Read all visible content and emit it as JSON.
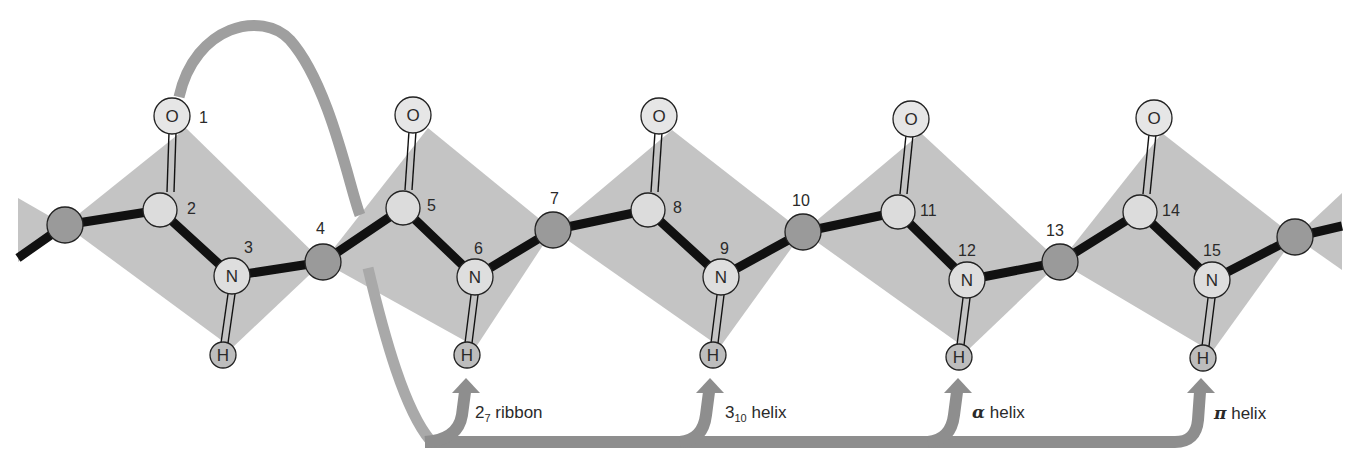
{
  "diagram": {
    "colors": {
      "plane": "#c4c4c4",
      "alpha_carbon": "#9a9a9a",
      "light_atom": "#dcdcdc",
      "bond": "#111111",
      "arrow": "#8e8e8e",
      "loop_ribbon": "#a9a9a9",
      "text": "#2a2a2a"
    },
    "atom_symbols": {
      "oxygen": "O",
      "nitrogen": "N",
      "hydrogen": "H"
    },
    "atom_numbers": [
      "1",
      "2",
      "3",
      "4",
      "5",
      "6",
      "7",
      "8",
      "9",
      "10",
      "11",
      "12",
      "13",
      "14",
      "15"
    ],
    "residues": [
      {
        "carbonyl_c": "2",
        "oxygen": "1",
        "nitrogen": "3",
        "alpha_after": "4"
      },
      {
        "carbonyl_c": "5",
        "oxygen": "",
        "nitrogen": "6",
        "alpha_after": "7"
      },
      {
        "carbonyl_c": "8",
        "oxygen": "",
        "nitrogen": "9",
        "alpha_after": "10"
      },
      {
        "carbonyl_c": "11",
        "oxygen": "",
        "nitrogen": "12",
        "alpha_after": "13"
      },
      {
        "carbonyl_c": "14",
        "oxygen": "",
        "nitrogen": "15",
        "alpha_after": ""
      }
    ],
    "hbond_arrows": [
      {
        "prefix": "2",
        "subscript": "7",
        "suffix": " ribbon",
        "target_atom": "H of N6"
      },
      {
        "prefix": "3",
        "subscript": "10",
        "suffix": " helix",
        "target_atom": "H of N9"
      },
      {
        "prefix": "α",
        "subscript": "",
        "suffix": " helix",
        "target_atom": "H of N12"
      },
      {
        "prefix": "π",
        "subscript": "",
        "suffix": " helix",
        "target_atom": "H of N15"
      }
    ],
    "source_atom": "O1"
  }
}
